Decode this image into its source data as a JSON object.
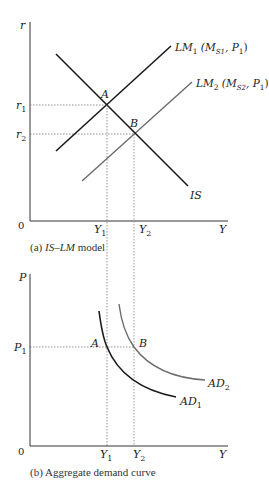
{
  "figure": {
    "colors": {
      "axis": "#333333",
      "curve_primary": "#1a1a1a",
      "curve_secondary": "#6b6b6b",
      "guide": "#777777"
    },
    "panel_a": {
      "caption_prefix": "(a) ",
      "caption_italic": "IS–LM",
      "caption_suffix": " model",
      "y_axis_label": "r",
      "x_axis_label": "Y",
      "origin_label": "0",
      "y_ticks": [
        {
          "base": "r",
          "sub": "1"
        },
        {
          "base": "r",
          "sub": "2"
        }
      ],
      "x_ticks": [
        {
          "base": "Y",
          "sub": "1"
        },
        {
          "base": "Y",
          "sub": "2"
        }
      ],
      "points": [
        {
          "label": "A"
        },
        {
          "label": "B"
        }
      ],
      "curves": {
        "lm1": {
          "base": "LM",
          "sub": "1",
          "args_open": " (M",
          "args_sub": "S1",
          "args_mid": ", P",
          "args_sub2": "1",
          "args_close": ")"
        },
        "lm2": {
          "base": "LM",
          "sub": "2",
          "args_open": " (M",
          "args_sub": "S2",
          "args_mid": ", P",
          "args_sub2": "1",
          "args_close": ")"
        },
        "is": {
          "label": "IS"
        }
      }
    },
    "panel_b": {
      "caption": "(b) Aggregate demand curve",
      "y_axis_label": "P",
      "x_axis_label": "Y",
      "origin_label": "0",
      "y_ticks": [
        {
          "base": "P",
          "sub": "1"
        }
      ],
      "x_ticks": [
        {
          "base": "Y",
          "sub": "1"
        },
        {
          "base": "Y",
          "sub": "2"
        }
      ],
      "points": [
        {
          "label": "A"
        },
        {
          "label": "B"
        }
      ],
      "curves": {
        "ad1": {
          "base": "AD",
          "sub": "1"
        },
        "ad2": {
          "base": "AD",
          "sub": "2"
        }
      }
    }
  }
}
